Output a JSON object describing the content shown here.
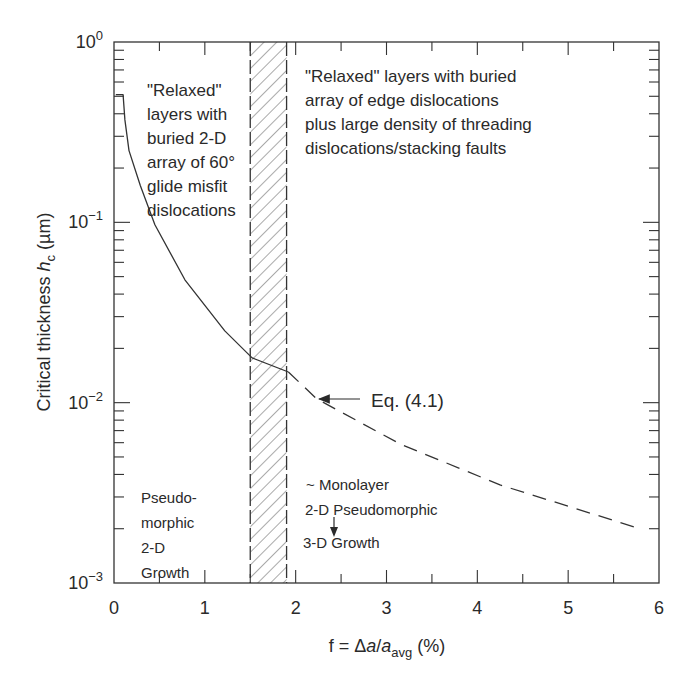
{
  "chart_data": {
    "type": "line",
    "title": "",
    "xlabel": "f = Δa/a_avg (%)",
    "xlabel_parts": {
      "prefix": "f = Δ",
      "a1": "a",
      "slash": "/",
      "a2": "a",
      "sub": "avg",
      "suffix": " (%)"
    },
    "ylabel": "Critical thickness h_c (µm)",
    "ylabel_parts": {
      "prefix": "Critical thickness ",
      "h": "h",
      "sub": "c",
      "suffix": " (µm)"
    },
    "xlim": [
      0,
      6
    ],
    "ylim": [
      0.001,
      1
    ],
    "yscale": "log",
    "x_ticks": [
      "0",
      "1",
      "2",
      "3",
      "4",
      "5",
      "6"
    ],
    "y_ticks": [
      {
        "base": "10",
        "exp": "0"
      },
      {
        "base": "10",
        "exp": "−1"
      },
      {
        "base": "10",
        "exp": "−2"
      },
      {
        "base": "10",
        "exp": "−3"
      }
    ],
    "grid": false,
    "legend": null,
    "series": [
      {
        "name": "Critical thickness (solid)",
        "style": "solid",
        "x": [
          0.02,
          0.1,
          0.12,
          0.165,
          0.29,
          0.45,
          0.78,
          1.22,
          1.52,
          1.92
        ],
        "y": [
          0.51,
          0.51,
          0.37,
          0.25,
          0.16,
          0.097,
          0.048,
          0.025,
          0.0177,
          0.0148
        ]
      },
      {
        "name": "Eq. (4.1) extrapolation (dashed)",
        "style": "dashed",
        "x": [
          1.92,
          2.23,
          3.15,
          4.25,
          5.79
        ],
        "y": [
          0.0148,
          0.0105,
          0.0059,
          0.0035,
          0.002
        ]
      }
    ],
    "shaded_region": {
      "x_from": 1.5,
      "x_to": 1.9,
      "pattern": "diagonal-hatch",
      "border": "dashed"
    },
    "annotations": [
      {
        "id": "relaxed_left",
        "lines": [
          "\"Relaxed\"",
          "layers with",
          "buried 2-D",
          "array of 60°",
          "glide misfit",
          "dislocations"
        ]
      },
      {
        "id": "relaxed_right",
        "lines": [
          "\"Relaxed\" layers with buried",
          "array of edge dislocations",
          "plus large density of threading",
          "dislocations/stacking faults"
        ]
      },
      {
        "id": "pseudomorphic",
        "lines": [
          "Pseudo-",
          "morphic",
          "2-D",
          "Growth"
        ]
      },
      {
        "id": "monolayer",
        "lines": [
          "~ Monolayer",
          "2-D Pseudomorphic",
          "3-D Growth"
        ]
      },
      {
        "id": "eq_label",
        "text": "Eq. (4.1)",
        "arrow_to": {
          "x": 2.23,
          "y": 0.0105
        }
      }
    ]
  }
}
